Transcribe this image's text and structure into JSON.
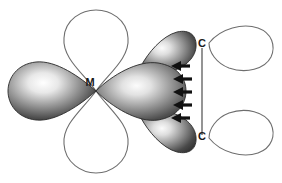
{
  "figure": {
    "background_color": "#ffffff",
    "width": 282,
    "height": 183
  },
  "labels": {
    "metal": "M",
    "carbon_top": "C",
    "carbon_bottom": "C"
  },
  "colors": {
    "outline_stroke": "#6e6e6e",
    "bond_stroke": "#7a7a7a",
    "arrow_fill": "#111111",
    "text_fill": "#1a1a1a",
    "lobe_dark": "#2b2b2b",
    "lobe_highlight": "#f2f2f2",
    "lobe_mid": "#8a8a8a"
  },
  "orbitals": {
    "metal_center": {
      "x": 96,
      "y": 91
    },
    "lobes": [
      {
        "name": "metal-lobe-left",
        "style": "filled",
        "direction": "left"
      },
      {
        "name": "metal-lobe-top",
        "style": "outline",
        "direction": "up"
      },
      {
        "name": "metal-lobe-bottom",
        "style": "outline",
        "direction": "down"
      },
      {
        "name": "metal-lobe-right",
        "style": "filled",
        "direction": "right"
      },
      {
        "name": "metal-lobe-upper-right",
        "style": "filled",
        "direction": "upper-right"
      },
      {
        "name": "metal-lobe-lower-right",
        "style": "filled",
        "direction": "lower-right"
      },
      {
        "name": "carbon-lobe-top",
        "style": "outline",
        "direction": "right"
      },
      {
        "name": "carbon-lobe-bottom",
        "style": "outline",
        "direction": "right"
      }
    ]
  },
  "arrows": {
    "count": 5,
    "direction": "left",
    "meaning": "backbonding-electron-flow",
    "positions": [
      {
        "x": 178,
        "y": 66
      },
      {
        "x": 180,
        "y": 79
      },
      {
        "x": 180,
        "y": 92
      },
      {
        "x": 180,
        "y": 105
      },
      {
        "x": 178,
        "y": 118
      }
    ]
  },
  "bond": {
    "name": "carbon-carbon-bond",
    "from": {
      "x": 202,
      "y": 48
    },
    "to": {
      "x": 202,
      "y": 135
    }
  }
}
